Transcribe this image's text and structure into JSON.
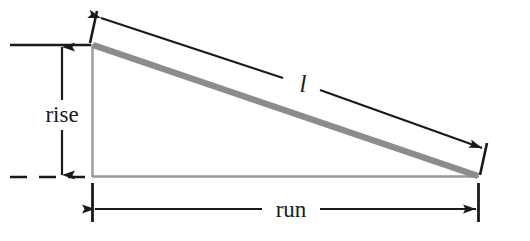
{
  "figure": {
    "type": "geometry-diagram",
    "background_color": "#ffffff",
    "colors": {
      "triangle_hypotenuse": "#8c8c8c",
      "triangle_legs": "#9a9a9a",
      "dimension_ink": "#1a1a1a",
      "text": "#1a1a1a"
    },
    "labels": {
      "rise": "rise",
      "run": "run",
      "length": "l"
    },
    "geometry": {
      "apex_top_left": [
        92,
        44
      ],
      "corner_bottom_left": [
        92,
        177
      ],
      "corner_bottom_right": [
        478,
        177
      ],
      "rise_px": 133,
      "run_px": 386
    },
    "dimensions": [
      {
        "name": "rise",
        "orientation": "vertical",
        "arrows": "both",
        "extension_top": "solid",
        "extension_bottom": "dashed"
      },
      {
        "name": "run",
        "orientation": "horizontal",
        "arrows": "both",
        "extension_left": "solid",
        "extension_right": "solid"
      },
      {
        "name": "l",
        "orientation": "diagonal",
        "arrows": "both",
        "placement": "parallel-offset-above-hypotenuse"
      }
    ]
  }
}
